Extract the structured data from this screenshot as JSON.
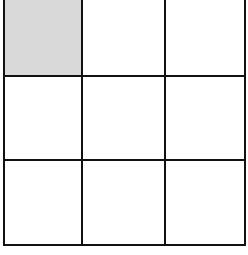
{
  "grid": {
    "rows": 3,
    "columns": 3,
    "line_color": "#111111",
    "shaded_color": "#d9d9d9",
    "cells": [
      {
        "row": 0,
        "col": 0,
        "shaded": true
      },
      {
        "row": 0,
        "col": 1,
        "shaded": false
      },
      {
        "row": 0,
        "col": 2,
        "shaded": false
      },
      {
        "row": 1,
        "col": 0,
        "shaded": false
      },
      {
        "row": 1,
        "col": 1,
        "shaded": false
      },
      {
        "row": 1,
        "col": 2,
        "shaded": false
      },
      {
        "row": 2,
        "col": 0,
        "shaded": false
      },
      {
        "row": 2,
        "col": 1,
        "shaded": false
      },
      {
        "row": 2,
        "col": 2,
        "shaded": false
      }
    ]
  }
}
